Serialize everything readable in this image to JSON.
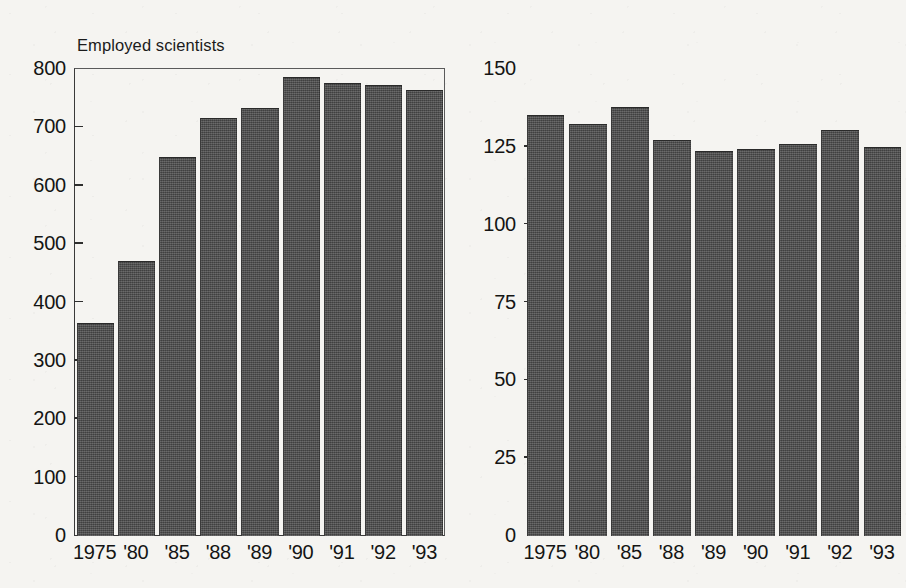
{
  "chart_data": [
    {
      "type": "bar",
      "panel": "left",
      "title": "Employed scientists",
      "xlabel": "",
      "ylabel": "",
      "categories": [
        "1975",
        "'80",
        "'85",
        "'88",
        "'89",
        "'90",
        "'91",
        "'92",
        "'93"
      ],
      "values": [
        363,
        469,
        648,
        715,
        732,
        785,
        774,
        771,
        763
      ],
      "ylim": [
        0,
        800
      ],
      "yticks": [
        0,
        100,
        200,
        300,
        400,
        500,
        600,
        700,
        800
      ],
      "ytick_labels": [
        "0",
        "100",
        "200",
        "300",
        "400",
        "500",
        "600",
        "700",
        "800"
      ],
      "grid": false,
      "legend": "none",
      "bar_color": "#4c4c4c"
    },
    {
      "type": "bar",
      "panel": "right",
      "title": "Cost per scientist or engineer in\nthousands of constant 1987 dollars",
      "xlabel": "",
      "ylabel": "",
      "categories": [
        "1975",
        "'80",
        "'85",
        "'88",
        "'89",
        "'90",
        "'91",
        "'92",
        "'93"
      ],
      "values": [
        135,
        132,
        137.5,
        127,
        123.5,
        124,
        125.5,
        130,
        124.5
      ],
      "ylim": [
        0,
        150
      ],
      "yticks": [
        0,
        25,
        50,
        75,
        100,
        125,
        150
      ],
      "ytick_labels": [
        "0",
        "25",
        "50",
        "75",
        "100",
        "125",
        "150"
      ],
      "grid": false,
      "legend": "none",
      "bar_color": "#4c4c4c"
    }
  ],
  "page": {
    "background_color": "#f5f4f1",
    "text_color": "#141414",
    "axis_color": "#3a3a3a"
  }
}
